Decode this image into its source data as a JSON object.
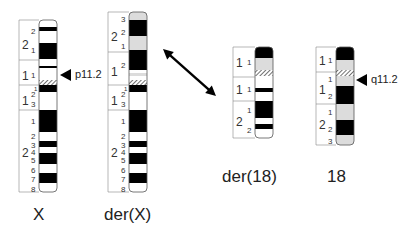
{
  "colors": {
    "black_band": "#000000",
    "white_band": "#ffffff",
    "gray_band": "#dcdcdc",
    "outline": "#555555",
    "label_line": "#888888"
  },
  "chromosomes": [
    {
      "id": "X",
      "name": "X",
      "box": {
        "x": 39,
        "top": 20,
        "bottom": 192,
        "width": 18
      },
      "label_col_x": 19,
      "region_lines": [
        20,
        60,
        85,
        110,
        192
      ],
      "arm_labels": [
        {
          "text": "2",
          "y": 44,
          "big": true
        },
        {
          "text": "1",
          "y": 75,
          "big": true
        },
        {
          "text": "1",
          "y": 100,
          "big": true
        },
        {
          "text": "2",
          "y": 152,
          "big": true
        }
      ],
      "band_labels": [
        {
          "text": "2",
          "y": 31
        },
        {
          "text": "1",
          "y": 50
        },
        {
          "text": "1",
          "y": 75
        },
        {
          "text": "1",
          "y": 88,
          "sup": true
        },
        {
          "text": "2",
          "y": 94
        },
        {
          "text": "3",
          "y": 104
        },
        {
          "text": "1",
          "y": 121
        },
        {
          "text": "2",
          "y": 136
        },
        {
          "text": "3",
          "y": 145
        },
        {
          "text": "4",
          "y": 152
        },
        {
          "text": "5",
          "y": 160
        },
        {
          "text": "6",
          "y": 170
        },
        {
          "text": "7",
          "y": 179
        },
        {
          "text": "8",
          "y": 189
        }
      ],
      "bands": [
        {
          "y1": 20,
          "y2": 27,
          "fill": "white"
        },
        {
          "y1": 27,
          "y2": 31,
          "fill": "black"
        },
        {
          "y1": 31,
          "y2": 43,
          "fill": "white"
        },
        {
          "y1": 43,
          "y2": 59,
          "fill": "black"
        },
        {
          "y1": 59,
          "y2": 66,
          "fill": "white"
        },
        {
          "y1": 66,
          "y2": 68,
          "fill": "black"
        },
        {
          "y1": 68,
          "y2": 80,
          "fill": "white"
        },
        {
          "y1": 80,
          "y2": 85,
          "fill": "hatch"
        },
        {
          "y1": 85,
          "y2": 92,
          "fill": "black"
        },
        {
          "y1": 92,
          "y2": 110,
          "fill": "white"
        },
        {
          "y1": 110,
          "y2": 132,
          "fill": "black"
        },
        {
          "y1": 132,
          "y2": 141,
          "fill": "white"
        },
        {
          "y1": 141,
          "y2": 147,
          "fill": "black"
        },
        {
          "y1": 147,
          "y2": 153,
          "fill": "white"
        },
        {
          "y1": 153,
          "y2": 164,
          "fill": "black"
        },
        {
          "y1": 164,
          "y2": 173,
          "fill": "white"
        },
        {
          "y1": 173,
          "y2": 183,
          "fill": "black"
        },
        {
          "y1": 183,
          "y2": 192,
          "fill": "white"
        }
      ],
      "caption": {
        "text": "X",
        "x": 33,
        "y": 205
      }
    },
    {
      "id": "derX",
      "name": "der(X)",
      "box": {
        "x": 129,
        "top": 12,
        "bottom": 192,
        "width": 18
      },
      "label_col_x": 108,
      "region_lines": [
        12,
        52,
        85,
        110,
        192
      ],
      "arm_labels": [
        {
          "text": "2",
          "y": 36,
          "big": true
        },
        {
          "text": "1",
          "y": 71,
          "big": true
        },
        {
          "text": "1",
          "y": 100,
          "big": true
        },
        {
          "text": "2",
          "y": 152,
          "big": true
        }
      ],
      "band_labels": [
        {
          "text": "3",
          "y": 19
        },
        {
          "text": "2",
          "y": 32
        },
        {
          "text": "1",
          "y": 46
        },
        {
          "text": "2",
          "y": 65
        },
        {
          "text": "1",
          "y": 88,
          "sup": true
        },
        {
          "text": "2",
          "y": 94
        },
        {
          "text": "3",
          "y": 104
        },
        {
          "text": "1",
          "y": 121
        },
        {
          "text": "2",
          "y": 136
        },
        {
          "text": "3",
          "y": 145
        },
        {
          "text": "4",
          "y": 152
        },
        {
          "text": "5",
          "y": 160
        },
        {
          "text": "6",
          "y": 170
        },
        {
          "text": "7",
          "y": 179
        },
        {
          "text": "8",
          "y": 189
        }
      ],
      "bands": [
        {
          "y1": 12,
          "y2": 20,
          "fill": "gray"
        },
        {
          "y1": 20,
          "y2": 36,
          "fill": "black"
        },
        {
          "y1": 36,
          "y2": 50,
          "fill": "gray"
        },
        {
          "y1": 50,
          "y2": 70,
          "fill": "black"
        },
        {
          "y1": 70,
          "y2": 73,
          "fill": "white"
        },
        {
          "y1": 73,
          "y2": 76,
          "fill": "gray"
        },
        {
          "y1": 76,
          "y2": 80,
          "fill": "white"
        },
        {
          "y1": 80,
          "y2": 85,
          "fill": "hatch"
        },
        {
          "y1": 85,
          "y2": 92,
          "fill": "black"
        },
        {
          "y1": 92,
          "y2": 110,
          "fill": "white"
        },
        {
          "y1": 110,
          "y2": 132,
          "fill": "black"
        },
        {
          "y1": 132,
          "y2": 141,
          "fill": "white"
        },
        {
          "y1": 141,
          "y2": 147,
          "fill": "black"
        },
        {
          "y1": 147,
          "y2": 153,
          "fill": "white"
        },
        {
          "y1": 153,
          "y2": 164,
          "fill": "black"
        },
        {
          "y1": 164,
          "y2": 173,
          "fill": "white"
        },
        {
          "y1": 173,
          "y2": 183,
          "fill": "black"
        },
        {
          "y1": 183,
          "y2": 192,
          "fill": "white"
        }
      ],
      "caption": {
        "text": "der(X)",
        "x": 104,
        "y": 205
      }
    },
    {
      "id": "der18",
      "name": "der(18)",
      "box": {
        "x": 255,
        "top": 47,
        "bottom": 138,
        "width": 18
      },
      "label_col_x": 233,
      "region_lines": [
        47,
        77,
        101,
        138
      ],
      "arm_labels": [
        {
          "text": "1",
          "y": 62,
          "big": true
        },
        {
          "text": "1",
          "y": 89,
          "big": true
        },
        {
          "text": "2",
          "y": 121,
          "big": true
        }
      ],
      "band_labels": [
        {
          "text": "1",
          "y": 62
        },
        {
          "text": "1",
          "y": 89
        },
        {
          "text": "1",
          "y": 110
        },
        {
          "text": "2",
          "y": 130
        }
      ],
      "bands": [
        {
          "y1": 47,
          "y2": 58,
          "fill": "black"
        },
        {
          "y1": 58,
          "y2": 70,
          "fill": "gray"
        },
        {
          "y1": 70,
          "y2": 76,
          "fill": "hatch"
        },
        {
          "y1": 76,
          "y2": 88,
          "fill": "white"
        },
        {
          "y1": 88,
          "y2": 92,
          "fill": "black"
        },
        {
          "y1": 92,
          "y2": 101,
          "fill": "white"
        },
        {
          "y1": 101,
          "y2": 118,
          "fill": "black"
        },
        {
          "y1": 118,
          "y2": 124,
          "fill": "white"
        },
        {
          "y1": 124,
          "y2": 129,
          "fill": "black"
        },
        {
          "y1": 129,
          "y2": 138,
          "fill": "white"
        }
      ],
      "caption": {
        "text": "der(18)",
        "x": 222,
        "y": 167
      }
    },
    {
      "id": "chr18",
      "name": "18",
      "box": {
        "x": 336,
        "top": 47,
        "bottom": 145,
        "width": 18
      },
      "label_col_x": 316,
      "region_lines": [
        47,
        72,
        104,
        145
      ],
      "arm_labels": [
        {
          "text": "1",
          "y": 60,
          "big": true
        },
        {
          "text": "1",
          "y": 89,
          "big": true
        },
        {
          "text": "2",
          "y": 124,
          "big": true
        }
      ],
      "band_labels": [
        {
          "text": "1",
          "y": 60
        },
        {
          "text": "1",
          "y": 79
        },
        {
          "text": "2",
          "y": 96
        },
        {
          "text": "1",
          "y": 112
        },
        {
          "text": "2",
          "y": 129
        },
        {
          "text": "3",
          "y": 141
        }
      ],
      "bands": [
        {
          "y1": 47,
          "y2": 60,
          "fill": "black"
        },
        {
          "y1": 60,
          "y2": 70,
          "fill": "gray"
        },
        {
          "y1": 70,
          "y2": 76,
          "fill": "hatch"
        },
        {
          "y1": 76,
          "y2": 86,
          "fill": "gray"
        },
        {
          "y1": 86,
          "y2": 104,
          "fill": "black"
        },
        {
          "y1": 104,
          "y2": 120,
          "fill": "gray"
        },
        {
          "y1": 120,
          "y2": 135,
          "fill": "black"
        },
        {
          "y1": 135,
          "y2": 145,
          "fill": "gray"
        }
      ],
      "caption": {
        "text": "18",
        "x": 327,
        "y": 167
      }
    }
  ],
  "breakpoints": [
    {
      "label": "p11.2",
      "icon": "triangle-pointer-left-icon",
      "tip_x": 60,
      "y": 75,
      "text_x": 75
    },
    {
      "label": "q11.2",
      "icon": "triangle-pointer-left-icon",
      "tip_x": 356,
      "y": 80,
      "text_x": 371
    }
  ],
  "translocation_arrow": {
    "icon": "double-headed-arrow-icon",
    "x1": 163,
    "y1": 49,
    "x2": 216,
    "y2": 96
  }
}
